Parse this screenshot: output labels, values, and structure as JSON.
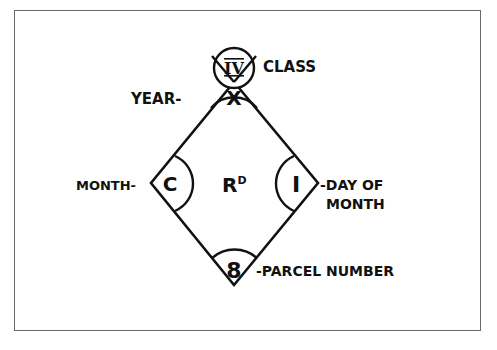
{
  "diagram": {
    "center_label": "R",
    "center_label_superscript": "D",
    "fields": {
      "class": {
        "value": "IV",
        "label": "CLASS"
      },
      "year": {
        "value": "X",
        "label": "YEAR-"
      },
      "month": {
        "value": "C",
        "label": "MONTH-"
      },
      "day": {
        "value": "I",
        "label_line1": "-DAY OF",
        "label_line2": "MONTH"
      },
      "parcel": {
        "value": "8",
        "label": "-PARCEL NUMBER"
      }
    }
  },
  "colors": {
    "ink": "#111111",
    "frame": "#6a6a6a",
    "background": "#ffffff"
  }
}
